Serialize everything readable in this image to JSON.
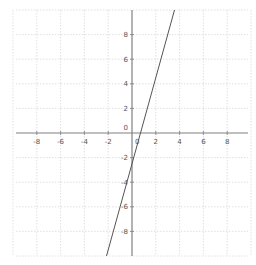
{
  "chart_data": {
    "type": "line",
    "title": "",
    "xlabel": "",
    "ylabel": "",
    "xlim": [
      -10,
      10
    ],
    "ylim": [
      -10,
      10
    ],
    "grid": true,
    "x_ticks": [
      -8,
      -6,
      -4,
      -2,
      0,
      2,
      4,
      6,
      8
    ],
    "y_ticks": [
      8,
      6,
      4,
      2,
      0,
      -2,
      -4,
      -6,
      -8
    ],
    "x_tick_labels": [
      "-8",
      "-6",
      "-4",
      "-2",
      "0",
      "2",
      "4",
      "6",
      "8"
    ],
    "y_tick_labels": [
      "8",
      "6",
      "4",
      "2",
      "0",
      "-2",
      "-4",
      "-6",
      "-8"
    ],
    "series": [
      {
        "name": "line",
        "equation": "y = 3.5x - 2.5",
        "slope": 3.5,
        "intercept": -2.5,
        "x": [
          -2.14,
          4.14
        ],
        "y": [
          -10,
          12
        ]
      }
    ]
  },
  "colors": {
    "axis": "#808080",
    "grid": "#d8d8d8",
    "line": "#555555",
    "label": "#555555"
  }
}
